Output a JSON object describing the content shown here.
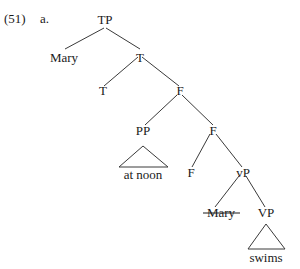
{
  "figure": {
    "example_number": "(51)",
    "sub_label": "a.",
    "width": 300,
    "height": 269
  },
  "tree": {
    "nodes": {
      "tp": "TP",
      "subject_mary": "Mary",
      "t_bar": "T",
      "t_head": "T",
      "f_upper": "F",
      "pp": "PP",
      "f_mid": "F",
      "pp_terminal": "at noon",
      "f_head": "F",
      "vp_small": "vP",
      "trace_mary": "Mary",
      "vp_big": "VP",
      "vp_terminal": "swims"
    },
    "triangles": [
      {
        "name": "pp-triangle",
        "label": "at noon"
      },
      {
        "name": "vp-triangle",
        "label": "swims"
      }
    ],
    "struck_through": [
      "trace_mary"
    ],
    "colors": {
      "line": "#3a3a3a",
      "text": "#1a1a1a",
      "background": "#ffffff"
    }
  }
}
